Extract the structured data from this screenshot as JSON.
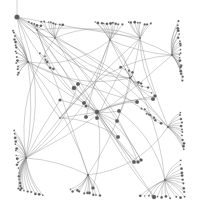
{
  "diagram": {
    "type": "network-graph",
    "background": "#ffffff",
    "edge_color": "#8a8a8a",
    "node_color": "#5a5a5a",
    "hubs": [
      {
        "id": "root",
        "x": 17,
        "y": 17,
        "r": 2.6
      },
      {
        "id": "tl_fan",
        "x": 28,
        "y": 62,
        "r": 1.2
      },
      {
        "id": "top_a",
        "x": 37,
        "y": 30,
        "r": 1.0
      },
      {
        "id": "top_b",
        "x": 55,
        "y": 38,
        "r": 1.0
      },
      {
        "id": "top_c",
        "x": 110,
        "y": 40,
        "r": 1.0
      },
      {
        "id": "top_d",
        "x": 140,
        "y": 38,
        "r": 1.0
      },
      {
        "id": "right_fan",
        "x": 172,
        "y": 55,
        "r": 1.2
      },
      {
        "id": "center",
        "x": 97,
        "y": 112,
        "r": 2.4
      },
      {
        "id": "mid_right",
        "x": 130,
        "y": 78,
        "r": 1.2
      },
      {
        "id": "left_fan",
        "x": 26,
        "y": 158,
        "r": 1.2
      },
      {
        "id": "bottom_fan",
        "x": 88,
        "y": 175,
        "r": 1.2
      },
      {
        "id": "br_fan",
        "x": 165,
        "y": 180,
        "r": 1.2
      },
      {
        "id": "r_mid_fan",
        "x": 168,
        "y": 127,
        "r": 1.2
      },
      {
        "id": "mid_left",
        "x": 60,
        "y": 118,
        "r": 1.0
      }
    ],
    "big_nodes": [
      {
        "x": 74,
        "y": 88,
        "r": 2.3
      },
      {
        "x": 78,
        "y": 84,
        "r": 2.0
      },
      {
        "x": 84,
        "y": 103,
        "r": 2.1
      },
      {
        "x": 86,
        "y": 117,
        "r": 2.0
      },
      {
        "x": 97,
        "y": 118,
        "r": 2.0
      },
      {
        "x": 119,
        "y": 111,
        "r": 2.0
      },
      {
        "x": 117,
        "y": 121,
        "r": 2.0
      },
      {
        "x": 137,
        "y": 102,
        "r": 2.0
      },
      {
        "x": 153,
        "y": 99,
        "r": 2.1
      },
      {
        "x": 118,
        "y": 137,
        "r": 2.0
      },
      {
        "x": 134,
        "y": 162,
        "r": 2.0
      },
      {
        "x": 154,
        "y": 197,
        "r": 2.2
      },
      {
        "x": 155,
        "y": 96,
        "r": 1.8
      },
      {
        "x": 141,
        "y": 160,
        "r": 1.8
      },
      {
        "x": 138,
        "y": 162,
        "r": 1.8
      },
      {
        "x": 93,
        "y": 188,
        "r": 1.8
      },
      {
        "x": 60,
        "y": 100,
        "r": 1.6
      },
      {
        "x": 86,
        "y": 106,
        "r": 1.6
      }
    ]
  }
}
